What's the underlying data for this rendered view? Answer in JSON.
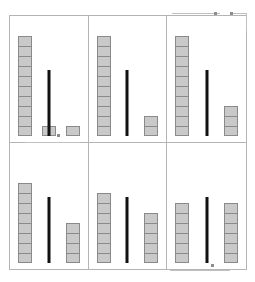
{
  "figure": {
    "title": "Block Comparison Grid",
    "panel_count": 6,
    "rows": 2,
    "columns": 3,
    "block_fill_color": "#c9c9c9",
    "block_border_color": "#8a8a8a",
    "divider_color": "#111111",
    "frame_color": "#b4b4b4",
    "background_color": "#ffffff"
  },
  "annotations": [
    {
      "name": "top-left-pointer",
      "label": ""
    },
    {
      "name": "top-right-pointer",
      "label": ""
    },
    {
      "name": "middle-pointer",
      "label": ""
    },
    {
      "name": "bottom-pointer",
      "label": ""
    }
  ],
  "chart_data": {
    "type": "bar",
    "title": "Block Comparison Grid",
    "subtitle": "",
    "xlabel": "",
    "ylabel": "Unit blocks",
    "grid": false,
    "legend": "none",
    "ylim": [
      0,
      11
    ],
    "categories": [
      "left",
      "right"
    ],
    "panels": [
      {
        "id": "panel-1",
        "position": "top-left",
        "categories": [
          "left",
          "right"
        ],
        "values": [
          10,
          1
        ],
        "extra_block_left": 1,
        "divider_height_units": 6,
        "total": 12
      },
      {
        "id": "panel-2",
        "position": "top-middle",
        "categories": [
          "left",
          "right"
        ],
        "values": [
          10,
          2
        ],
        "extra_block_left": 0,
        "divider_height_units": 6,
        "total": 12
      },
      {
        "id": "panel-3",
        "position": "top-right",
        "categories": [
          "left",
          "right"
        ],
        "values": [
          10,
          3
        ],
        "extra_block_left": 0,
        "divider_height_units": 6,
        "total": 13
      },
      {
        "id": "panel-4",
        "position": "bottom-left",
        "categories": [
          "left",
          "right"
        ],
        "values": [
          8,
          4
        ],
        "extra_block_left": 0,
        "divider_height_units": 6,
        "total": 12
      },
      {
        "id": "panel-5",
        "position": "bottom-middle",
        "categories": [
          "left",
          "right"
        ],
        "values": [
          7,
          5
        ],
        "extra_block_left": 0,
        "divider_height_units": 6,
        "total": 12
      },
      {
        "id": "panel-6",
        "position": "bottom-right",
        "categories": [
          "left",
          "right"
        ],
        "values": [
          6,
          6
        ],
        "extra_block_left": 0,
        "divider_height_units": 6,
        "total": 12
      }
    ]
  }
}
